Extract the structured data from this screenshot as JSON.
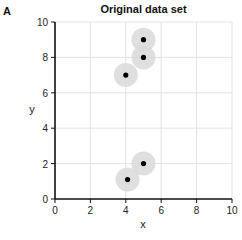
{
  "panel_label": "A",
  "chart_data": {
    "type": "scatter",
    "title": "Original data set",
    "xlabel": "x",
    "ylabel": "y",
    "xlim": [
      0,
      10
    ],
    "ylim": [
      0,
      10
    ],
    "xticks": [
      0,
      2,
      4,
      6,
      8,
      10
    ],
    "yticks": [
      0,
      2,
      4,
      6,
      8,
      10
    ],
    "grid": true,
    "legend": null,
    "points": [
      {
        "x": 5,
        "y": 9
      },
      {
        "x": 5,
        "y": 8
      },
      {
        "x": 4,
        "y": 7
      },
      {
        "x": 5,
        "y": 2
      },
      {
        "x": 4.1,
        "y": 1.1
      }
    ],
    "marker_color": "#000000",
    "halo_color": "#d9d9d9",
    "grid_color": "#e2e2e2"
  }
}
